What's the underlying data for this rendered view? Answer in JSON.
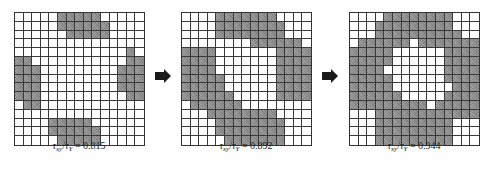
{
  "colors": {
    "filled": "#8d8d8d",
    "empty": "#ffffff",
    "gridline": "#3a3a3a",
    "arrow": "#1a1a1a"
  },
  "grid_size": {
    "rows": 15,
    "cols": 15
  },
  "panels": [
    {
      "label": {
        "tau": "τ",
        "sub1": "xy",
        "slash": "/",
        "sub2": "Y",
        "eq": " = 0.815"
      },
      "ratio": "0.815",
      "rows": [
        [
          0,
          0,
          0,
          0,
          0,
          1,
          1,
          1,
          1,
          1,
          0,
          0,
          0,
          0,
          0
        ],
        [
          0,
          0,
          0,
          0,
          0,
          1,
          1,
          1,
          1,
          1,
          1,
          0,
          0,
          0,
          0
        ],
        [
          0,
          0,
          0,
          0,
          0,
          0,
          1,
          1,
          1,
          1,
          1,
          0,
          0,
          0,
          0
        ],
        [
          0,
          0,
          0,
          0,
          0,
          0,
          0,
          0,
          0,
          0,
          0,
          0,
          0,
          0,
          0
        ],
        [
          0,
          0,
          0,
          0,
          0,
          0,
          0,
          0,
          0,
          0,
          0,
          0,
          0,
          1,
          0
        ],
        [
          1,
          1,
          0,
          0,
          0,
          0,
          0,
          0,
          0,
          0,
          0,
          0,
          0,
          1,
          1
        ],
        [
          1,
          1,
          1,
          0,
          0,
          0,
          0,
          0,
          0,
          0,
          0,
          0,
          1,
          1,
          1
        ],
        [
          1,
          1,
          1,
          0,
          0,
          0,
          0,
          0,
          0,
          0,
          0,
          0,
          1,
          1,
          1
        ],
        [
          1,
          1,
          1,
          0,
          0,
          0,
          0,
          0,
          0,
          0,
          0,
          0,
          1,
          1,
          1
        ],
        [
          1,
          1,
          1,
          0,
          0,
          0,
          0,
          0,
          0,
          0,
          0,
          0,
          0,
          1,
          1
        ],
        [
          0,
          1,
          1,
          0,
          0,
          0,
          0,
          0,
          0,
          0,
          0,
          0,
          0,
          0,
          0
        ],
        [
          0,
          0,
          0,
          0,
          0,
          0,
          0,
          0,
          0,
          0,
          0,
          0,
          0,
          0,
          0
        ],
        [
          0,
          0,
          0,
          0,
          1,
          1,
          1,
          1,
          1,
          0,
          0,
          0,
          0,
          0,
          0
        ],
        [
          0,
          0,
          0,
          0,
          1,
          1,
          1,
          1,
          1,
          1,
          0,
          0,
          0,
          0,
          0
        ],
        [
          0,
          0,
          0,
          0,
          0,
          1,
          1,
          1,
          1,
          1,
          0,
          0,
          0,
          0,
          0
        ]
      ]
    },
    {
      "label": {
        "tau": "τ",
        "sub1": "xy",
        "slash": "/",
        "sub2": "Y",
        "eq": " = 0.892"
      },
      "ratio": "0.892",
      "rows": [
        [
          0,
          0,
          0,
          0,
          1,
          1,
          1,
          1,
          1,
          1,
          1,
          0,
          0,
          0,
          0
        ],
        [
          0,
          0,
          0,
          0,
          1,
          1,
          1,
          1,
          1,
          1,
          1,
          1,
          0,
          0,
          0
        ],
        [
          0,
          0,
          0,
          0,
          1,
          1,
          1,
          1,
          1,
          1,
          1,
          1,
          0,
          0,
          0
        ],
        [
          0,
          0,
          0,
          0,
          0,
          0,
          0,
          0,
          1,
          1,
          1,
          1,
          1,
          1,
          0
        ],
        [
          1,
          1,
          1,
          1,
          0,
          0,
          0,
          0,
          0,
          0,
          0,
          1,
          1,
          1,
          1
        ],
        [
          1,
          1,
          1,
          1,
          0,
          0,
          0,
          0,
          0,
          0,
          0,
          1,
          1,
          1,
          1
        ],
        [
          1,
          1,
          1,
          1,
          0,
          0,
          0,
          0,
          0,
          0,
          0,
          1,
          1,
          1,
          1
        ],
        [
          1,
          1,
          1,
          1,
          1,
          0,
          0,
          0,
          0,
          0,
          0,
          1,
          1,
          1,
          1
        ],
        [
          1,
          1,
          1,
          1,
          1,
          0,
          0,
          0,
          0,
          0,
          0,
          1,
          1,
          1,
          1
        ],
        [
          1,
          1,
          1,
          1,
          1,
          1,
          0,
          0,
          0,
          0,
          0,
          1,
          1,
          1,
          1
        ],
        [
          0,
          1,
          1,
          1,
          1,
          1,
          1,
          0,
          0,
          0,
          0,
          0,
          0,
          0,
          0
        ],
        [
          0,
          0,
          0,
          1,
          1,
          1,
          1,
          1,
          1,
          1,
          1,
          0,
          0,
          0,
          0
        ],
        [
          0,
          0,
          0,
          0,
          1,
          1,
          1,
          1,
          1,
          1,
          1,
          1,
          0,
          0,
          0
        ],
        [
          0,
          0,
          0,
          0,
          1,
          1,
          1,
          1,
          1,
          1,
          1,
          1,
          0,
          0,
          0
        ],
        [
          0,
          0,
          0,
          0,
          0,
          1,
          1,
          1,
          1,
          1,
          1,
          1,
          0,
          0,
          0
        ]
      ]
    },
    {
      "label": {
        "tau": "τ",
        "sub1": "xy",
        "slash": "/",
        "sub2": "Y",
        "eq": " = 0.944"
      },
      "ratio": "0.944",
      "rows": [
        [
          0,
          0,
          0,
          0,
          1,
          1,
          1,
          1,
          1,
          1,
          1,
          1,
          0,
          0,
          0
        ],
        [
          0,
          0,
          0,
          1,
          1,
          1,
          1,
          1,
          1,
          1,
          1,
          1,
          0,
          0,
          0
        ],
        [
          0,
          0,
          0,
          1,
          1,
          1,
          1,
          1,
          1,
          1,
          1,
          1,
          1,
          0,
          0
        ],
        [
          0,
          1,
          1,
          1,
          1,
          1,
          1,
          0,
          1,
          1,
          1,
          1,
          1,
          1,
          1
        ],
        [
          1,
          1,
          1,
          1,
          1,
          0,
          0,
          0,
          0,
          0,
          0,
          1,
          1,
          1,
          1
        ],
        [
          1,
          1,
          1,
          1,
          1,
          0,
          0,
          0,
          0,
          0,
          0,
          1,
          1,
          1,
          1
        ],
        [
          1,
          1,
          1,
          1,
          0,
          0,
          0,
          0,
          0,
          0,
          0,
          1,
          1,
          1,
          1
        ],
        [
          1,
          1,
          1,
          1,
          1,
          0,
          0,
          0,
          0,
          0,
          0,
          1,
          1,
          1,
          1
        ],
        [
          1,
          1,
          1,
          1,
          1,
          0,
          0,
          0,
          0,
          0,
          0,
          0,
          1,
          1,
          1
        ],
        [
          1,
          1,
          1,
          1,
          1,
          1,
          0,
          0,
          0,
          0,
          0,
          1,
          1,
          1,
          1
        ],
        [
          1,
          1,
          1,
          1,
          1,
          1,
          1,
          1,
          1,
          0,
          1,
          1,
          1,
          1,
          1
        ],
        [
          0,
          0,
          0,
          1,
          1,
          1,
          1,
          1,
          1,
          1,
          1,
          1,
          1,
          1,
          1
        ],
        [
          0,
          0,
          0,
          1,
          1,
          1,
          1,
          1,
          1,
          1,
          1,
          1,
          0,
          0,
          0
        ],
        [
          0,
          0,
          0,
          1,
          1,
          1,
          1,
          1,
          1,
          1,
          1,
          1,
          0,
          0,
          0
        ],
        [
          0,
          0,
          0,
          1,
          1,
          1,
          1,
          1,
          1,
          1,
          1,
          1,
          0,
          0,
          0
        ]
      ]
    }
  ],
  "arrows": [
    {
      "icon": "right-arrow-icon"
    },
    {
      "icon": "right-arrow-icon"
    }
  ]
}
